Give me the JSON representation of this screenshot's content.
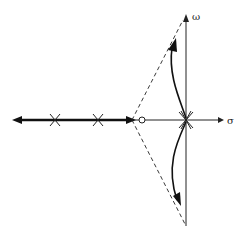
{
  "diagram": {
    "type": "root-locus",
    "axes": {
      "real_label": "σ",
      "imag_label": "ω"
    },
    "poles": [
      {
        "name": "pole-1",
        "x": 55
      },
      {
        "name": "pole-2",
        "x": 98
      },
      {
        "name": "pole-origin",
        "x": 186,
        "multiplicity": "multiple"
      }
    ],
    "zeros": [
      {
        "name": "zero-1",
        "x": 142
      }
    ],
    "colors": {
      "line": "#222222",
      "background": "#ffffff"
    }
  }
}
